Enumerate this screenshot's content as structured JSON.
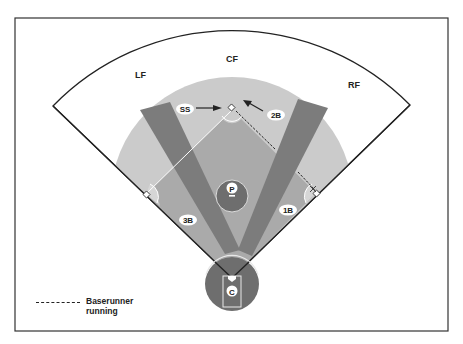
{
  "diagram": {
    "type": "baseball-field-positions",
    "colors": {
      "outfield": "#ffffff",
      "infield_dirt": "#c8c8c8",
      "infield_grass": "#a9a9a9",
      "lanes": "#7a7a7a",
      "circles": "#6e6e6e",
      "lines": "#222222"
    },
    "outfield_labels": {
      "lf": "LF",
      "cf": "CF",
      "rf": "RF"
    },
    "infield_labels": {
      "ss": "SS",
      "second_base": "2B",
      "first_base": "1B",
      "third_base": "3B",
      "pitcher": "P",
      "catcher": "C"
    },
    "legend": {
      "line_style": "dashed",
      "label": "Baserunner running"
    }
  }
}
